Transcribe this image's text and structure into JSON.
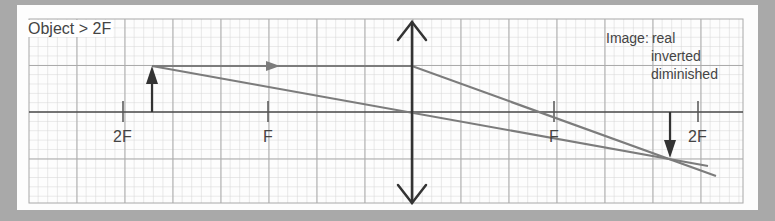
{
  "title": "Object > 2F",
  "image_properties": {
    "label": "Image:",
    "values": [
      "real",
      "inverted",
      "diminished"
    ]
  },
  "axis_marks": [
    {
      "label": "2F",
      "side": "left",
      "x": 123
    },
    {
      "label": "F",
      "side": "left",
      "x": 268
    },
    {
      "label": "F",
      "side": "right",
      "x": 554
    },
    {
      "label": "2F",
      "side": "right",
      "x": 698
    }
  ],
  "lens": {
    "type": "converging",
    "x": 412
  },
  "object": {
    "type": "upright-arrow",
    "x": 152,
    "top_y": 66
  },
  "image": {
    "type": "inverted-arrow",
    "x": 669,
    "bottom_y": 158
  },
  "colors": {
    "background": "#a9a9a9",
    "card": "#fdfdfd",
    "grid_minor": "#d2d2d2",
    "grid_major": "#a8a8a8",
    "axis": "#4a4a4a",
    "ray": "#7a7a7a",
    "arrow": "#333333",
    "text": "#444444"
  }
}
